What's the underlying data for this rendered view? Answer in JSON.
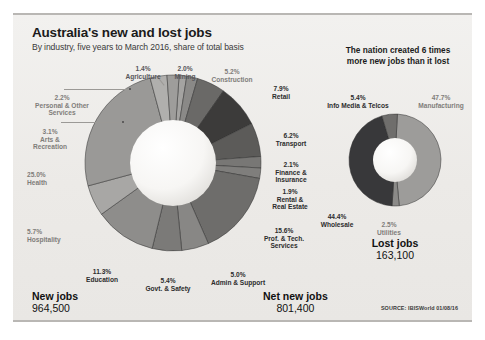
{
  "header": {
    "title": "Australia's new and lost jobs",
    "subtitle": "By industry, five years to March 2016, share of total basis",
    "banner_line1": "The nation created 6 times",
    "banner_line2": "more new jobs than it lost"
  },
  "source": "SOURCE: IBISWorld 01/08/16",
  "totals": {
    "new_label": "New jobs",
    "new_value": "964,500",
    "net_label": "Net new jobs",
    "net_value": "801,400",
    "lost_label": "Lost jobs",
    "lost_value": "163,100"
  },
  "chart_data": [
    {
      "type": "pie",
      "title": "New jobs",
      "subtitle": "By industry, five years to March 2016, share of total basis",
      "total": "964,500",
      "units": "percent of total new jobs",
      "legend": "labels around donut",
      "categories": [
        "Health",
        "Prof. & Tech. Services",
        "Education",
        "Retail",
        "Transport",
        "Hospitality",
        "Govt. & Safety",
        "Admin & Support",
        "Construction",
        "Arts & Recreation",
        "Personal & Other Services",
        "Finance & Insurance",
        "Mining",
        "Rental & Real Estate",
        "Agriculture"
      ],
      "values": [
        25.0,
        15.6,
        11.3,
        7.9,
        6.2,
        5.7,
        5.4,
        5.0,
        5.2,
        3.1,
        2.2,
        2.1,
        2.0,
        1.9,
        1.4
      ],
      "colors": [
        "#9a9997",
        "#6e6d6b",
        "#8e8d8b",
        "#3c3b3a",
        "#5c5b59",
        "#a8a7a5",
        "#7b7a78",
        "#888785",
        "#6a6967",
        "#b0afad",
        "#9e9d9b",
        "#787775",
        "#8a8987",
        "#7f7e7c",
        "#a4a3a1"
      ]
    },
    {
      "type": "pie",
      "title": "Lost jobs",
      "total": "163,100",
      "units": "percent of total lost jobs",
      "categories": [
        "Manufacturing",
        "Wholesale",
        "Info Media & Telcos",
        "Utilities"
      ],
      "values": [
        47.7,
        44.4,
        5.4,
        2.5
      ],
      "colors": [
        "#9d9c9a",
        "#38383a",
        "#6f6e6c",
        "#8b8a88"
      ]
    }
  ],
  "new_labels": [
    {
      "pct": "1.4%",
      "name": "Agriculture"
    },
    {
      "pct": "2.0%",
      "name": "Mining"
    },
    {
      "pct": "5.2%",
      "name": "Construction"
    },
    {
      "pct": "7.9%",
      "name": "Retail"
    },
    {
      "pct": "6.2%",
      "name": "Transport"
    },
    {
      "pct": "2.1%",
      "name": "Finance & Insurance"
    },
    {
      "pct": "1.9%",
      "name": "Rental & Real Estate"
    },
    {
      "pct": "15.6%",
      "name": "Prof. & Tech. Services"
    },
    {
      "pct": "5.0%",
      "name": "Admin & Support"
    },
    {
      "pct": "5.4%",
      "name": "Govt. & Safety"
    },
    {
      "pct": "11.3%",
      "name": "Education"
    },
    {
      "pct": "5.7%",
      "name": "Hospitality"
    },
    {
      "pct": "25.0%",
      "name": "Health"
    },
    {
      "pct": "3.1%",
      "name": "Arts & Recreation"
    },
    {
      "pct": "2.2%",
      "name": "Personal & Other Services"
    }
  ],
  "lost_labels": [
    {
      "pct": "5.4%",
      "name": "Info Media & Telcos"
    },
    {
      "pct": "47.7%",
      "name": "Manufacturing"
    },
    {
      "pct": "44.4%",
      "name": "Wholesale"
    },
    {
      "pct": "2.5%",
      "name": "Utilities"
    }
  ],
  "label_text": {
    "agriculture_pct": "1.4%",
    "agriculture_name": "Agriculture",
    "mining_pct": "2.0%",
    "mining_name": "Mining",
    "construction_pct": "5.2%",
    "construction_name": "Construction",
    "retail_pct": "7.9%",
    "retail_name": "Retail",
    "transport_pct": "6.2%",
    "transport_name": "Transport",
    "finance_pct": "2.1%",
    "finance_l1": "Finance &",
    "finance_l2": "Insurance",
    "rental_pct": "1.9%",
    "rental_l1": "Rental &",
    "rental_l2": "Real Estate",
    "prof_pct": "15.6%",
    "prof_l1": "Prof. & Tech.",
    "prof_l2": "Services",
    "admin_pct": "5.0%",
    "admin_name": "Admin & Support",
    "govt_pct": "5.4%",
    "govt_name": "Govt. & Safety",
    "education_pct": "11.3%",
    "education_name": "Education",
    "hospitality_pct": "5.7%",
    "hospitality_name": "Hospitality",
    "health_pct": "25.0%",
    "health_name": "Health",
    "arts_pct": "3.1%",
    "arts_l1": "Arts &",
    "arts_l2": "Recreation",
    "personal_pct": "2.2%",
    "personal_l1": "Personal & Other",
    "personal_l2": "Services",
    "info_pct": "5.4%",
    "info_name": "Info Media & Telcos",
    "manufacturing_pct": "47.7%",
    "manufacturing_name": "Manufacturing",
    "wholesale_pct": "44.4%",
    "wholesale_name": "Wholesale",
    "utilities_pct": "2.5%",
    "utilities_name": "Utilities"
  }
}
